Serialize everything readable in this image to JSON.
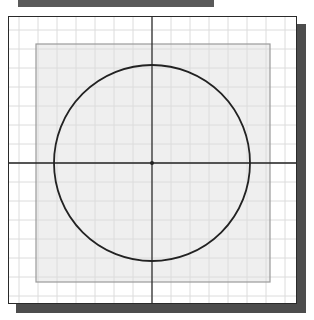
{
  "diagram": {
    "type": "circle-on-grid",
    "colors": {
      "background": "#ffffff",
      "grid_line": "#dcdcdc",
      "inner_rect_fill": "#efefef",
      "inner_rect_stroke": "#9a9a9a",
      "frame_stroke": "#2a2a2a",
      "shadow": "#4d4d4d",
      "topbar": "#5a5a5a",
      "axis": "#222222",
      "circle": "#222222"
    },
    "grid": {
      "spacing": 19,
      "origin_x": 152,
      "origin_y": 163
    },
    "frame": {
      "x": 8,
      "y": 16,
      "width": 289,
      "height": 288
    },
    "inner_rect": {
      "x": 36,
      "y": 44,
      "width": 234,
      "height": 238
    },
    "circle": {
      "cx": 152,
      "cy": 163,
      "r": 98
    },
    "axes": {
      "horizontal_y": 163,
      "vertical_x": 152
    },
    "center_point": {
      "x": 152,
      "y": 163
    }
  }
}
